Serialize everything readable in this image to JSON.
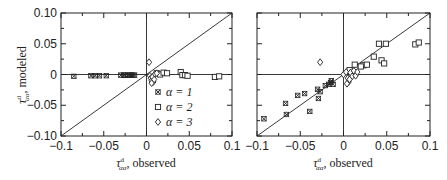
{
  "chart_data": [
    {
      "type": "scatter",
      "panel": "left",
      "title": "",
      "xlabel": "τ^d_αα, observed",
      "ylabel": "τ^d_αα, modeled",
      "xlim": [
        -0.1,
        0.1
      ],
      "ylim": [
        -0.1,
        0.1
      ],
      "xticks": [
        "-0.1",
        "-0.05",
        "0",
        "0.05",
        "0.1"
      ],
      "yticks": [
        "0.10",
        "0.05",
        "0",
        "-0.05",
        "-0.10"
      ],
      "grid": false,
      "reference_lines": [
        "y = x",
        "x = 0",
        "y = 0"
      ],
      "legend": {
        "position": "lower right",
        "entries": [
          "α = 1",
          "α = 2",
          "α = 3"
        ]
      },
      "series": [
        {
          "name": "α = 1",
          "marker": "star",
          "x": [
            -0.085,
            -0.065,
            -0.06,
            -0.055,
            -0.047,
            -0.03,
            -0.027,
            -0.025,
            -0.022,
            -0.02,
            -0.018,
            -0.016,
            -0.014
          ],
          "y": [
            -0.003,
            -0.002,
            -0.002,
            -0.002,
            -0.002,
            -0.001,
            -0.001,
            -0.001,
            -0.001,
            -0.001,
            -0.001,
            -0.001,
            -0.001
          ]
        },
        {
          "name": "α = 2",
          "marker": "square",
          "x": [
            0.012,
            0.016,
            0.02,
            0.024,
            0.04,
            0.042,
            0.045,
            0.048,
            0.08,
            0.085
          ],
          "y": [
            0.002,
            0.0,
            0.003,
            0.002,
            0.004,
            -0.001,
            -0.001,
            -0.002,
            -0.004,
            -0.003
          ]
        },
        {
          "name": "α = 3",
          "marker": "diamond",
          "x": [
            0.003,
            0.004,
            0.005,
            0.006,
            0.007,
            0.008,
            0.009,
            0.01,
            0.006,
            0.012
          ],
          "y": [
            0.02,
            -0.002,
            -0.006,
            -0.01,
            -0.004,
            -0.012,
            -0.008,
            0.001,
            -0.014,
            0.002
          ]
        }
      ]
    },
    {
      "type": "scatter",
      "panel": "right",
      "title": "",
      "xlabel": "τ^d_αα, observed",
      "ylabel": "",
      "xlim": [
        -0.1,
        0.1
      ],
      "ylim": [
        -0.1,
        0.1
      ],
      "xticks": [
        "-0.1",
        "-0.05",
        "0",
        "0.05",
        "0.1"
      ],
      "grid": false,
      "reference_lines": [
        "y = x",
        "x = 0",
        "y = 0"
      ],
      "series": [
        {
          "name": "α = 1",
          "marker": "star",
          "x": [
            -0.092,
            -0.067,
            -0.066,
            -0.053,
            -0.045,
            -0.039,
            -0.03,
            -0.029,
            -0.027,
            -0.021,
            -0.017,
            -0.015,
            -0.014,
            -0.012
          ],
          "y": [
            -0.072,
            -0.047,
            -0.065,
            -0.034,
            -0.031,
            -0.06,
            -0.024,
            -0.039,
            -0.028,
            -0.018,
            -0.016,
            -0.013,
            -0.01,
            -0.016
          ]
        },
        {
          "name": "α = 2",
          "marker": "square",
          "x": [
            0.041,
            0.049,
            0.083,
            0.087,
            0.044,
            0.047,
            0.035,
            0.023,
            0.027,
            0.013,
            0.02,
            0.007
          ],
          "y": [
            0.05,
            0.05,
            0.049,
            0.052,
            0.023,
            0.018,
            0.029,
            0.015,
            0.016,
            0.016,
            0.013,
            0.007
          ]
        },
        {
          "name": "α = 3",
          "marker": "diamond",
          "x": [
            -0.027,
            0.0,
            0.003,
            0.005,
            0.006,
            0.008,
            0.01,
            0.012,
            0.014,
            0.016,
            0.004,
            0.007
          ],
          "y": [
            0.02,
            0.0,
            0.004,
            -0.006,
            -0.012,
            0.003,
            -0.003,
            0.006,
            -0.002,
            0.004,
            -0.015,
            -0.008
          ]
        }
      ]
    }
  ],
  "labels": {
    "left_ylabel_main": "τ",
    "left_ylabel_rest": ", modeled",
    "xlabel_main": "τ",
    "xlabel_rest": ", observed",
    "sup": "d",
    "sub": "αα",
    "legend": [
      "α = 1",
      "α = 2",
      "α = 3"
    ]
  }
}
